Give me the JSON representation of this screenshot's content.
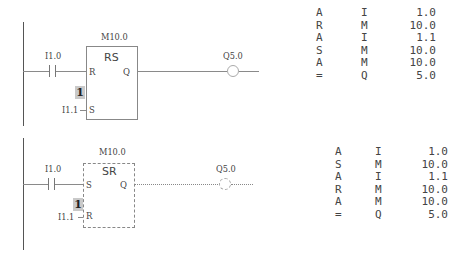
{
  "networks": [
    {
      "name": "RS flip-flop",
      "contact": {
        "address": "I1.0"
      },
      "block": {
        "address": "M10.0",
        "type": "RS",
        "pin_top": "R",
        "pin_bottom": "S",
        "pin_out": "Q",
        "style": "solid"
      },
      "constant": "1",
      "bottom_input": "I1.1",
      "coil": {
        "address": "Q5.0"
      },
      "stl": [
        {
          "op": "A",
          "type": "I",
          "value": "1.0"
        },
        {
          "op": "R",
          "type": "M",
          "value": "10.0"
        },
        {
          "op": "A",
          "type": "I",
          "value": "1.1"
        },
        {
          "op": "S",
          "type": "M",
          "value": "10.0"
        },
        {
          "op": "A",
          "type": "M",
          "value": "10.0"
        },
        {
          "op": "=",
          "type": "Q",
          "value": "5.0"
        }
      ]
    },
    {
      "name": "SR flip-flop",
      "contact": {
        "address": "I1.0"
      },
      "block": {
        "address": "M10.0",
        "type": "SR",
        "pin_top": "S",
        "pin_bottom": "R",
        "pin_out": "Q",
        "style": "dashed"
      },
      "constant": "1",
      "bottom_input": "I1.1",
      "coil": {
        "address": "Q5.0"
      },
      "stl": [
        {
          "op": "A",
          "type": "I",
          "value": "1.0"
        },
        {
          "op": "S",
          "type": "M",
          "value": "10.0"
        },
        {
          "op": "A",
          "type": "I",
          "value": "1.1"
        },
        {
          "op": "R",
          "type": "M",
          "value": "10.0"
        },
        {
          "op": "A",
          "type": "M",
          "value": "10.0"
        },
        {
          "op": "=",
          "type": "Q",
          "value": "5.0"
        }
      ]
    }
  ]
}
